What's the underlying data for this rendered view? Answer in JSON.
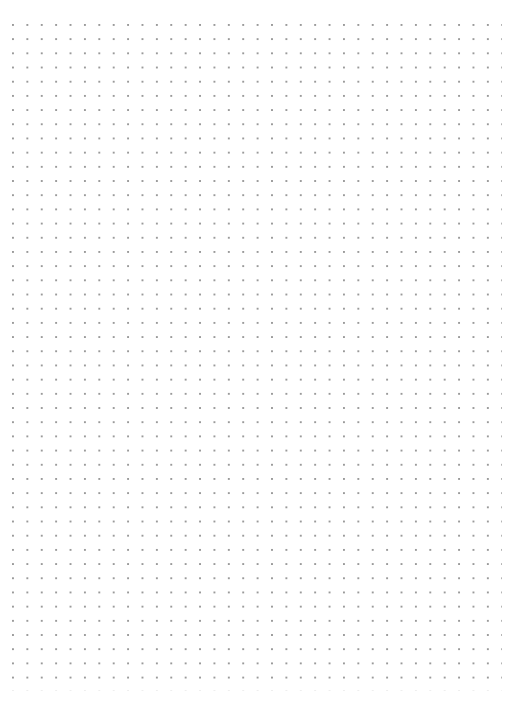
{
  "page": {
    "type": "dot-grid-paper",
    "background_color": "#ffffff",
    "dot_color": "#9a9a9a",
    "grid": {
      "columns": 34,
      "rows": 47,
      "spacing_x_px": 14.4,
      "spacing_y_px": 14.2,
      "origin_x_px": 13,
      "origin_y_px": 25
    }
  }
}
